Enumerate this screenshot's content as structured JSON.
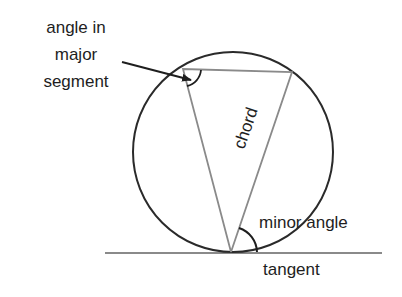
{
  "diagram": {
    "labels": {
      "major_line1": "angle in",
      "major_line2": "major",
      "major_line3": "segment",
      "chord": "chord",
      "minor_angle": "minor angle",
      "tangent": "tangent"
    },
    "colors": {
      "circle": "#2a2a2a",
      "triangle": "#8a8a8a",
      "tangent": "#8a8a8a",
      "arrow": "#1e1e1e",
      "text": "#1e1e1e"
    },
    "geometry": {
      "circle": {
        "cx": 233,
        "cy": 152,
        "r": 100
      },
      "tangent_point": [
        231,
        252
      ],
      "vertex_left": [
        183,
        69
      ],
      "vertex_right": [
        292,
        72
      ],
      "tangent_line": {
        "x1": 105,
        "x2": 382,
        "y": 253
      }
    }
  }
}
